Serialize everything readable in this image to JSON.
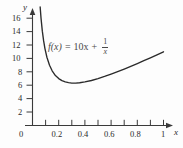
{
  "figure": {
    "background_color": "#fdfdfd",
    "curve_color": "#2b2b2b",
    "axis_color": "#3a3a3a"
  },
  "formula": {
    "function_name": "f(x)",
    "equals": "=",
    "linear_term": "10x",
    "plus": "+",
    "fraction_numerator": "1",
    "fraction_denominator": "x",
    "full_text": "f(x) = 10x + 1/x"
  },
  "axes": {
    "x_label": "x",
    "y_label": "y",
    "origin_label": "0"
  },
  "chart_data": {
    "type": "line",
    "title": "",
    "subtitle": "",
    "xlabel": "x",
    "ylabel": "y",
    "xlim": [
      0,
      1.08
    ],
    "ylim": [
      0,
      17.2
    ],
    "grid": false,
    "legend": null,
    "annotations": [
      {
        "text": "f(x) = 10x + 1/x",
        "x": 0.26,
        "y": 12.4
      }
    ],
    "x_ticks_major": [
      0.2,
      0.4,
      0.6,
      0.8,
      1
    ],
    "x_tick_labels": [
      "0.2",
      "0.4",
      "0.6",
      "0.8",
      "1"
    ],
    "x_ticks_minor": [
      0.1,
      0.3,
      0.5,
      0.7,
      0.9
    ],
    "y_ticks_major": [
      2,
      4,
      6,
      8,
      10,
      12,
      14,
      16
    ],
    "y_tick_labels": [
      "2",
      "4",
      "6",
      "8",
      "10",
      "12",
      "14",
      "16"
    ],
    "series": [
      {
        "name": "f(x) = 10x + 1/x",
        "color": "#2b2b2b",
        "equation": "10*x + 1/x",
        "x": [
          0.0585,
          0.065,
          0.075,
          0.085,
          0.095,
          0.11,
          0.13,
          0.15,
          0.175,
          0.2,
          0.225,
          0.25,
          0.275,
          0.3,
          0.3162,
          0.33,
          0.36,
          0.4,
          0.45,
          0.5,
          0.55,
          0.6,
          0.65,
          0.7,
          0.75,
          0.8,
          0.85,
          0.9,
          0.95,
          1.0
        ],
        "y": [
          17.68,
          16.03,
          14.08,
          12.62,
          11.48,
          10.19,
          8.99,
          8.17,
          7.46,
          7.0,
          6.69,
          6.5,
          6.39,
          6.33,
          6.325,
          6.33,
          6.38,
          6.5,
          6.72,
          7.0,
          7.32,
          7.67,
          8.04,
          8.43,
          8.83,
          9.25,
          9.68,
          10.11,
          10.55,
          11.0
        ],
        "minimum": {
          "x": 0.3162,
          "y": 6.32
        }
      }
    ]
  }
}
